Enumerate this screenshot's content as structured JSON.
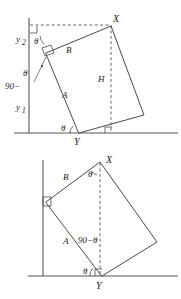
{
  "diagram": {
    "stroke_color": "#4a4a4a",
    "axis_color": "#555555",
    "label_color": "#1b1b1b",
    "upper": {
      "name": "upper-figure",
      "labels": {
        "vertex_x": "X",
        "vertex_y": "Y",
        "side_a": "A",
        "side_b": "B",
        "height_h": "H",
        "y_upper": "y",
        "y_upper_sub": "2",
        "y_lower": "y",
        "y_lower_sub": "1",
        "theta_top": "θ",
        "theta_bottom": "θ",
        "complement_prefix": "90−",
        "complement_theta": "θ"
      }
    },
    "lower": {
      "name": "lower-figure",
      "labels": {
        "vertex_x": "X",
        "vertex_y": "Y",
        "side_a": "A",
        "side_b": "B",
        "theta_top": "θ",
        "theta_bottom": "θ",
        "complement": "90−θ"
      }
    }
  }
}
